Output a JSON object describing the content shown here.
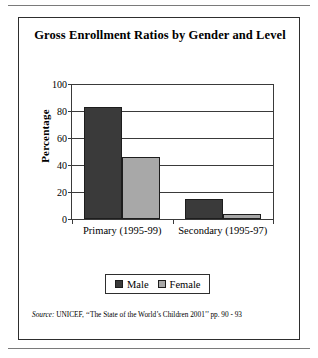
{
  "figure": {
    "title": "Gross Enrollment Ratios by Gender and Level",
    "source_label": "Source:",
    "source_text": "UNICEF, ‘‘The State of the World’s Children 2001’’ pp. 90 - 93"
  },
  "colors": {
    "male": "#3a3a3a",
    "female": "#a8a8a8",
    "axis": "#3a3a3a",
    "frame": "#2e2e2e",
    "background": "#ffffff"
  },
  "chart_data": {
    "type": "bar",
    "title": "Gross Enrollment Ratios by Gender and Level",
    "xlabel": "",
    "ylabel": "Percentage",
    "categories": [
      "Primary (1995-99)",
      "Secondary (1995-97)"
    ],
    "series": [
      {
        "name": "Male",
        "values": [
          83,
          15
        ],
        "color": "#3a3a3a"
      },
      {
        "name": "Female",
        "values": [
          46,
          4
        ],
        "color": "#a8a8a8"
      }
    ],
    "ylim": [
      0,
      100
    ],
    "yticks": [
      0,
      20,
      40,
      60,
      80,
      100
    ],
    "ytick_labels": [
      "0",
      "20",
      "40",
      "60",
      "80",
      "100"
    ],
    "grid": true,
    "grid_axis": "y",
    "legend_position": "bottom",
    "legend_entries": [
      "Male",
      "Female"
    ]
  }
}
